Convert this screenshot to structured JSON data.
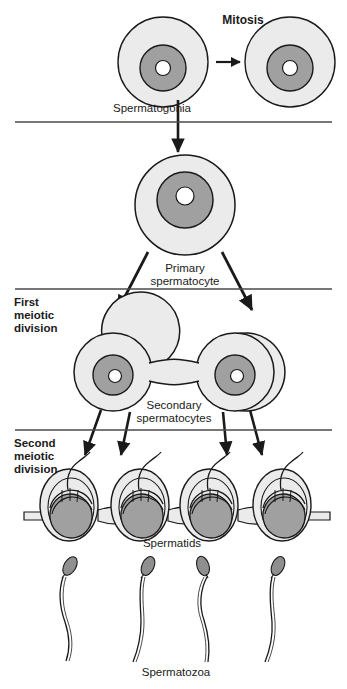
{
  "diagram": {
    "width": 347,
    "height": 689,
    "background_color": "#ffffff",
    "outline_color": "#1a1a1a",
    "cytoplasm_color": "#ebebeb",
    "nucleus_color": "#a0a0a0",
    "nucleolus_color": "#ffffff",
    "sperm_head_color": "#8f8f8f",
    "label_color": "#1a1a1a"
  },
  "labels": {
    "mitosis": "Mitosis",
    "spermatogonia": "Spermatogonia",
    "primary_line1": "Primary",
    "primary_line2": "spermatocyte",
    "first_meiotic_line1": "First",
    "first_meiotic_line2": "meiotic",
    "first_meiotic_line3": "division",
    "secondary_line1": "Secondary",
    "secondary_line2": "spermatocytes",
    "second_meiotic_line1": "Second",
    "second_meiotic_line2": "meiotic",
    "second_meiotic_line3": "division",
    "spermatids": "Spermatids",
    "spermatozoa": "Spermatozoa"
  },
  "stages": [
    {
      "id": "spermatogonia",
      "label": "Spermatogonia",
      "cell_count": 2,
      "process": "Mitosis",
      "description": "Two spermatogonia cells undergoing mitotic division"
    },
    {
      "id": "primary-spermatocyte",
      "label": "Primary spermatocyte",
      "cell_count": 1,
      "process": "First meiotic division",
      "description": "Single large primary spermatocyte"
    },
    {
      "id": "secondary-spermatocytes",
      "label": "Secondary spermatocytes",
      "cell_count": 2,
      "process": "Second meiotic division",
      "description": "Two secondary spermatocytes joined by a cytoplasmic bridge"
    },
    {
      "id": "spermatids",
      "label": "Spermatids",
      "cell_count": 4,
      "process": "Spermiogenesis",
      "description": "Four spermatids connected by cytoplasmic bridges"
    },
    {
      "id": "spermatozoa",
      "label": "Spermatozoa",
      "cell_count": 4,
      "process": "",
      "description": "Four mature spermatozoa with heads and flagella"
    }
  ],
  "dividers": [
    {
      "id": "divider-1",
      "y": 122
    },
    {
      "id": "divider-2",
      "y": 289
    },
    {
      "id": "divider-3",
      "y": 430
    }
  ]
}
